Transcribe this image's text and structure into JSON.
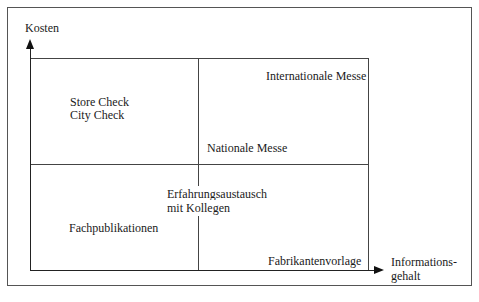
{
  "diagram": {
    "type": "2x2 matrix",
    "y_axis_label": "Kosten",
    "x_axis_label_line1": "Informations-",
    "x_axis_label_line2": "gehalt",
    "items": {
      "store_check": "Store Check",
      "city_check": "City Check",
      "internationale_messe": "Internationale Messe",
      "nationale_messe": "Nationale Messe",
      "erfahrungsaustausch_line1": "Erfahrungsaustausch",
      "erfahrungsaustausch_line2": "mit Kollegen",
      "fachpublikationen": "Fachpublikationen",
      "fabrikantenvorlage": "Fabrikantenvorlage"
    }
  }
}
